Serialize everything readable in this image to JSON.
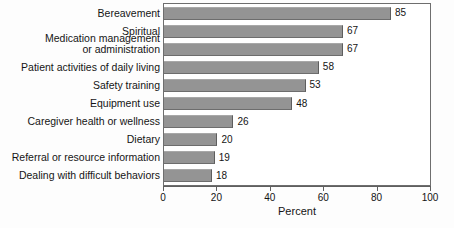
{
  "chart_data": {
    "type": "bar",
    "orientation": "horizontal",
    "title": "",
    "xlabel": "Percent",
    "ylabel": "",
    "xlim": [
      0,
      100
    ],
    "xticks": [
      0,
      20,
      40,
      60,
      80,
      100
    ],
    "xtick_labels": [
      "0",
      "20",
      "40",
      "60",
      "80",
      "100"
    ],
    "grid": false,
    "legend": false,
    "bar_color": "#949494",
    "categories": [
      "Bereavement",
      "Spiritual",
      "Medication management or administration",
      "Patient activities of daily living",
      "Safety training",
      "Equipment use",
      "Caregiver health or wellness",
      "Dietary",
      "Referral or resource information",
      "Dealing with difficult behaviors"
    ],
    "values": [
      85,
      67,
      67,
      58,
      53,
      48,
      26,
      20,
      19,
      18
    ],
    "value_labels": [
      "85",
      "67",
      "67",
      "58",
      "53",
      "48",
      "26",
      "20",
      "19",
      "18"
    ]
  },
  "labels": {
    "rows": [
      {
        "line1": "Bereavement",
        "line2": ""
      },
      {
        "line1": "Spiritual",
        "line2": ""
      },
      {
        "line1": "Medication management",
        "line2": "or administration"
      },
      {
        "line1": "Patient activities of daily living",
        "line2": ""
      },
      {
        "line1": "Safety training",
        "line2": ""
      },
      {
        "line1": "Equipment use",
        "line2": ""
      },
      {
        "line1": "Caregiver health or wellness",
        "line2": ""
      },
      {
        "line1": "Dietary",
        "line2": ""
      },
      {
        "line1": "Referral or resource information",
        "line2": ""
      },
      {
        "line1": "Dealing with difficult behaviors",
        "line2": ""
      }
    ]
  }
}
